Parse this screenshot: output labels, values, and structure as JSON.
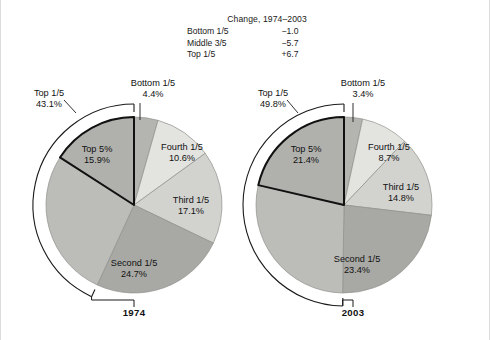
{
  "header": {
    "title": "Change, 1974–2003",
    "rows": [
      {
        "label": "Bottom 1/5",
        "value": "−1.0"
      },
      {
        "label": "Middle 3/5",
        "value": "−5.7"
      },
      {
        "label": "Top 1/5",
        "value": "+6.7"
      }
    ]
  },
  "chart_data": [
    {
      "type": "pie",
      "title": "1974",
      "start_angle_deg": 0,
      "direction": "clockwise",
      "categories": [
        "Bottom 1/5",
        "Fourth 1/5",
        "Third 1/5",
        "Second 1/5",
        "Top 1/5 minus Top 5%",
        "Top 5%"
      ],
      "values": [
        4.4,
        10.6,
        17.1,
        24.7,
        27.2,
        15.9
      ],
      "labels": [
        {
          "name": "Bottom 1/5",
          "value": "4.4%",
          "placement": "callout-top"
        },
        {
          "name": "Fourth 1/5",
          "value": "10.6%",
          "placement": "inside"
        },
        {
          "name": "Third 1/5",
          "value": "17.1%",
          "placement": "inside"
        },
        {
          "name": "Second 1/5",
          "value": "24.7%",
          "placement": "inside"
        },
        {
          "name": "Top 5%",
          "value": "15.9%",
          "placement": "inside"
        },
        {
          "name": "Top 1/5",
          "value": "43.1%",
          "placement": "bracket-left"
        }
      ],
      "bracket_span_percent": 43.1,
      "colors": [
        "#b4b4b0",
        "#e3e3e0",
        "#d2d2ce",
        "#a8a8a4",
        "#bcbcb8",
        "#b0b0ac"
      ]
    },
    {
      "type": "pie",
      "title": "2003",
      "start_angle_deg": 0,
      "direction": "clockwise",
      "categories": [
        "Bottom 1/5",
        "Fourth 1/5",
        "Third 1/5",
        "Second 1/5",
        "Top 1/5 minus Top 5%",
        "Top 5%"
      ],
      "values": [
        3.4,
        8.7,
        14.8,
        23.4,
        28.4,
        21.4
      ],
      "labels": [
        {
          "name": "Bottom 1/5",
          "value": "3.4%",
          "placement": "callout-top"
        },
        {
          "name": "Fourth 1/5",
          "value": "8.7%",
          "placement": "inside"
        },
        {
          "name": "Third 1/5",
          "value": "14.8%",
          "placement": "inside"
        },
        {
          "name": "Second 1/5",
          "value": "23.4%",
          "placement": "inside"
        },
        {
          "name": "Top 5%",
          "value": "21.4%",
          "placement": "inside"
        },
        {
          "name": "Top 1/5",
          "value": "49.8%",
          "placement": "bracket-left"
        }
      ],
      "bracket_span_percent": 49.8,
      "colors": [
        "#b4b4b0",
        "#e3e3e0",
        "#d2d2ce",
        "#a8a8a4",
        "#bcbcb8",
        "#b0b0ac"
      ]
    }
  ],
  "style": {
    "slice_stroke": "#8f8f8b",
    "highlight_stroke": "#111111",
    "bracket_stroke": "#1a1a1a",
    "leader_stroke": "#1a1a1a",
    "label_text": "#111111",
    "frame_border": "#dcdcdc"
  }
}
